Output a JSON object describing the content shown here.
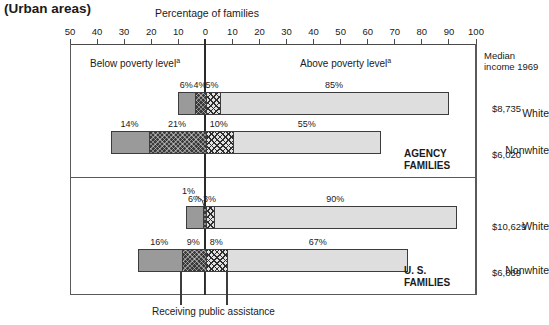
{
  "header": {
    "urban_title": "(Urban areas)",
    "axis_title": "Percentage of families"
  },
  "axis": {
    "left_region_label": "Below poverty level",
    "right_region_label": "Above poverty level",
    "footnote_marker": "a",
    "ticks": [
      "50",
      "40",
      "30",
      "20",
      "10",
      "0",
      "10",
      "20",
      "30",
      "40",
      "50",
      "60",
      "70",
      "80",
      "90",
      "100"
    ]
  },
  "right_column": {
    "header": "Median income 1969"
  },
  "groups": [
    {
      "caption": "AGENCY FAMILIES"
    },
    {
      "caption": "U. S. FAMILIES"
    }
  ],
  "rows": [
    {
      "label": "White",
      "income": "$8,735"
    },
    {
      "label": "Nonwhite",
      "income": "$6,020"
    },
    {
      "label": "White",
      "income": "$10,629"
    },
    {
      "label": "Nonwhite",
      "income": "$6,839"
    }
  ],
  "footer": {
    "caption": "Receiving public assistance"
  },
  "chart_data": {
    "type": "bar",
    "orientation": "horizontal",
    "subtype": "diverging-stacked",
    "title": "Percentage of families",
    "supertitle": "(Urban areas)",
    "xlabel": "Percentage of families",
    "ylabel": "",
    "xlim": [
      -50,
      100
    ],
    "xticks": [
      -50,
      -40,
      -30,
      -20,
      -10,
      0,
      10,
      20,
      30,
      40,
      50,
      60,
      70,
      80,
      90,
      100
    ],
    "xticklabels": [
      "50",
      "40",
      "30",
      "20",
      "10",
      "0",
      "10",
      "20",
      "30",
      "40",
      "50",
      "60",
      "70",
      "80",
      "90",
      "100"
    ],
    "grid": false,
    "legend": "none",
    "zero_reference": 0,
    "annotations": [
      "Below poverty level a",
      "Above poverty level a",
      "Receiving public assistance",
      "AGENCY FAMILIES",
      "U. S. FAMILIES",
      "Median income 1969"
    ],
    "categories": [
      "White (Agency)",
      "Nonwhite (Agency)",
      "White (U.S.)",
      "Nonwhite (U.S.)"
    ],
    "series": [
      {
        "name": "Below poverty, not receiving public assistance",
        "pattern": "solid-gray",
        "values": [
          6,
          14,
          6,
          16
        ]
      },
      {
        "name": "Below poverty, receiving public assistance",
        "pattern": "dark-crosshatch",
        "values": [
          4,
          21,
          1,
          9
        ]
      },
      {
        "name": "Above poverty, receiving public assistance",
        "pattern": "light-crosshatch",
        "values": [
          5,
          10,
          3,
          8
        ]
      },
      {
        "name": "Above poverty, not receiving public assistance",
        "pattern": "light-gray",
        "values": [
          85,
          55,
          90,
          67
        ]
      }
    ],
    "data_labels": [
      [
        "6%",
        "4%",
        "5%",
        "85%"
      ],
      [
        "14%",
        "21%",
        "10%",
        "55%"
      ],
      [
        "6%",
        "1%",
        "3%",
        "90%"
      ],
      [
        "16%",
        "9%",
        "8%",
        "67%"
      ]
    ],
    "median_income_1969": [
      "$8,735",
      "$6,020",
      "$10,629",
      "$6,839"
    ],
    "colors": {
      "solid_gray": "#9a9a9a",
      "dark_crosshatch": "#3a3a3a",
      "light_crosshatch": "#e2e2e2",
      "light_gray": "#dedede",
      "axis": "#4a4a4a",
      "frame": "#5a5a5a",
      "text": "#1a1a1a"
    }
  }
}
